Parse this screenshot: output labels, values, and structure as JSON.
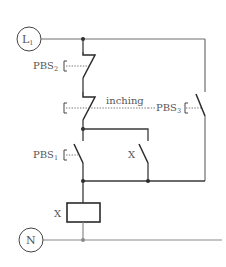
{
  "diagram": {
    "type": "relay-ladder-circuit",
    "terminals": {
      "line": {
        "label": "L",
        "subscript": "1"
      },
      "neutral": {
        "label": "N"
      }
    },
    "switches": [
      {
        "id": "pbs2",
        "label": "PBS",
        "subscript": "2",
        "type": "normally-closed push button"
      },
      {
        "id": "pbs3_nc",
        "label": "",
        "type": "normally-closed push button (mechanically linked to PBS3)"
      },
      {
        "id": "pbs3_no",
        "label": "PBS",
        "subscript": "3",
        "type": "normally-open push button"
      },
      {
        "id": "pbs1",
        "label": "PBS",
        "subscript": "1",
        "type": "normally-open push button"
      },
      {
        "id": "x_contact",
        "label": "X",
        "type": "normally-open relay contact (self-holding)"
      }
    ],
    "linkage_label": "inching",
    "coil": {
      "label": "X"
    },
    "colors": {
      "wire": "#3a3a3a",
      "light_wire": "#8a8a8a",
      "text": "#555555",
      "background": "#ffffff"
    }
  }
}
